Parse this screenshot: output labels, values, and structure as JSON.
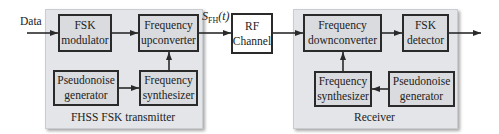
{
  "input_label": "Data",
  "signal_label": {
    "main": "S",
    "sub": "FH",
    "arg": "(t)"
  },
  "transmitter": {
    "title": "FHSS FSK transmitter",
    "blocks": {
      "fsk_modulator": [
        "FSK",
        "modulator"
      ],
      "frequency_upconverter": [
        "Frequency",
        "upconverter"
      ],
      "pseudonoise_generator": [
        "Pseudonoise",
        "generator"
      ],
      "frequency_synthesizer": [
        "Frequency",
        "synthesizer"
      ]
    }
  },
  "channel": {
    "block": [
      "RF",
      "Channel"
    ]
  },
  "receiver": {
    "title": "Receiver",
    "blocks": {
      "frequency_downconverter": [
        "Frequency",
        "downconverter"
      ],
      "fsk_detector": [
        "FSK",
        "detector"
      ],
      "frequency_synthesizer": [
        "Frequency",
        "synthesizer"
      ],
      "pseudonoise_generator": [
        "Pseudonoise",
        "generator"
      ]
    }
  },
  "colors": {
    "panel": "#e3e5e8",
    "block": "#d9dbde",
    "line": "#2a2a2a"
  }
}
